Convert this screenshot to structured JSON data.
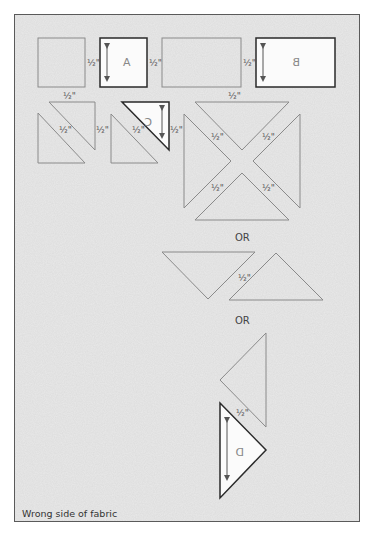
{
  "diagram": {
    "caption": "Wrong side of fabric",
    "seam_allowance_label": "½\"",
    "or_labels": [
      "OR",
      "OR"
    ],
    "colors": {
      "background": "#e9e9e9",
      "frame": "#5a5a5a",
      "cutting_line": "#8a8a8a",
      "template_outline": "#2a2a2a",
      "template_fill": "#fbfbfb"
    },
    "templates": [
      {
        "id": "A",
        "label": "A",
        "shape": "square",
        "mirrored": false
      },
      {
        "id": "B",
        "label": "B",
        "shape": "rectangle",
        "mirrored": true
      },
      {
        "id": "C",
        "label": "C",
        "shape": "half-square triangle",
        "rotated": true
      },
      {
        "id": "D",
        "label": "D",
        "shape": "quarter-square triangle",
        "mirrored": true
      }
    ],
    "seam_labels": [
      {
        "text": "½\"",
        "x": 87,
        "y": 66
      },
      {
        "text": "½\"",
        "x": 149,
        "y": 66
      },
      {
        "text": "½\"",
        "x": 243,
        "y": 66
      },
      {
        "text": "½\"",
        "x": 63,
        "y": 99
      },
      {
        "text": "½\"",
        "x": 228,
        "y": 99
      },
      {
        "text": "½\"",
        "x": 59,
        "y": 131
      },
      {
        "text": "½\"",
        "x": 96,
        "y": 131
      },
      {
        "text": "½\"",
        "x": 132,
        "y": 131
      },
      {
        "text": "½\"",
        "x": 170,
        "y": 131
      },
      {
        "text": "½\"",
        "x": 211,
        "y": 137
      },
      {
        "text": "½\"",
        "x": 263,
        "y": 137
      },
      {
        "text": "½\"",
        "x": 211,
        "y": 189
      },
      {
        "text": "½\"",
        "x": 263,
        "y": 189
      },
      {
        "text": "½\"",
        "x": 240,
        "y": 279
      },
      {
        "text": "½\"",
        "x": 238,
        "y": 414
      }
    ]
  }
}
